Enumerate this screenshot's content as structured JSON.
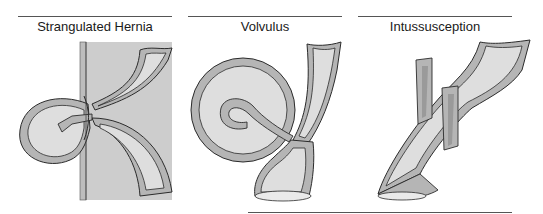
{
  "figure": {
    "panels": [
      {
        "id": "strangulated-hernia",
        "title": "Strangulated Hernia"
      },
      {
        "id": "volvulus",
        "title": "Volvulus"
      },
      {
        "id": "intussusception",
        "title": "Intussusception"
      }
    ]
  },
  "colors": {
    "background": "#ffffff",
    "abdominal_wall_box": "#cdcdcd",
    "bowel_wall": "#b5b5b5",
    "lumen": "#dedede",
    "outline": "#2b2b2b",
    "rule": "#555555"
  }
}
